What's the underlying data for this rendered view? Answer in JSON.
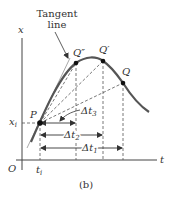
{
  "figure": {
    "caption": "(b)",
    "annotation": {
      "line1": "Tangent",
      "line2": "line"
    },
    "axes": {
      "x_label": "t",
      "y_label": "x",
      "origin_label": "O",
      "t_tick_label": "t",
      "t_tick_sub": "i",
      "x_tick_label": "x",
      "x_tick_sub": "i"
    },
    "points": {
      "P": "P",
      "Q2": "Q″",
      "Q1": "Q′",
      "Q": "Q"
    },
    "intervals": {
      "dt1": {
        "main": "Δt",
        "sub": "1"
      },
      "dt2": {
        "main": "Δt",
        "sub": "2"
      },
      "dt3": {
        "main": "Δt",
        "sub": "3"
      }
    },
    "colors": {
      "curve": "#555555",
      "tangent": "#aaaaaa",
      "dashed": "#555555",
      "text": "#333333"
    }
  }
}
